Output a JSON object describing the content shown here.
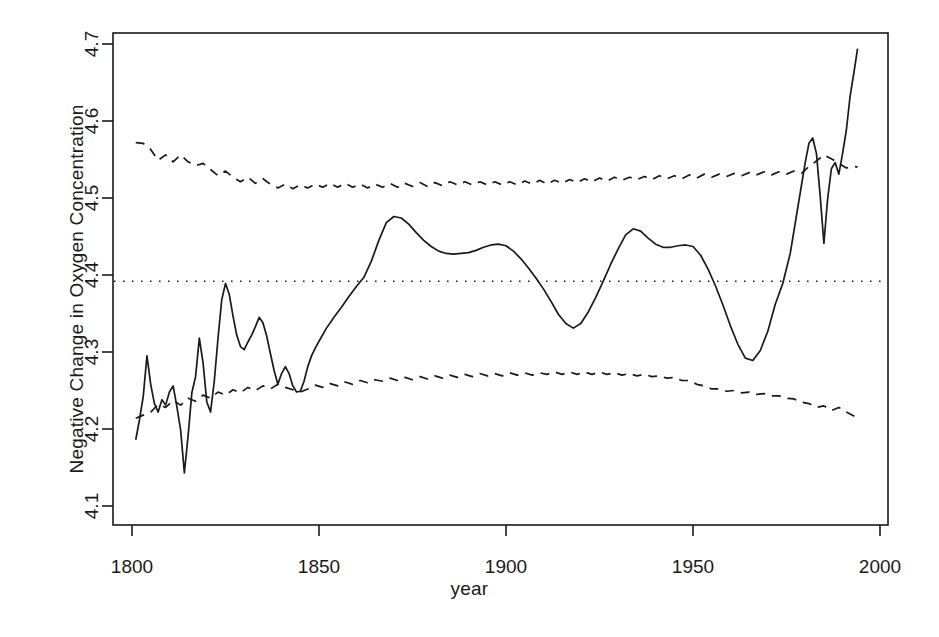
{
  "chart_data": {
    "type": "line",
    "title": "",
    "xlabel": "year",
    "ylabel": "Negative Change in Oxygen Concentration",
    "xlim": [
      1801,
      1995
    ],
    "ylim": [
      4.085,
      4.715
    ],
    "xticks": [
      1800,
      1850,
      1900,
      1950,
      2000
    ],
    "yticks": [
      4.1,
      4.2,
      4.3,
      4.4,
      4.5,
      4.6,
      4.7
    ],
    "grid": false,
    "legend": null,
    "reference_line": {
      "style": "dotted",
      "orientation": "horizontal",
      "y": 4.392,
      "label": ""
    },
    "series": [
      {
        "name": "estimate",
        "style": "solid",
        "color": "#1a1a1a",
        "x": [
          1801,
          1802,
          1803,
          1804,
          1805,
          1806,
          1807,
          1808,
          1809,
          1810,
          1811,
          1812,
          1813,
          1814,
          1815,
          1816,
          1817,
          1818,
          1819,
          1820,
          1821,
          1822,
          1823,
          1824,
          1825,
          1826,
          1827,
          1828,
          1829,
          1830,
          1831,
          1832,
          1833,
          1834,
          1835,
          1836,
          1837,
          1838,
          1839,
          1840,
          1841,
          1842,
          1843,
          1844,
          1845,
          1846,
          1847,
          1848,
          1849,
          1850,
          1852,
          1854,
          1856,
          1858,
          1860,
          1862,
          1864,
          1866,
          1868,
          1870,
          1872,
          1874,
          1876,
          1878,
          1880,
          1882,
          1884,
          1886,
          1888,
          1890,
          1892,
          1894,
          1896,
          1898,
          1900,
          1902,
          1904,
          1906,
          1908,
          1910,
          1912,
          1914,
          1916,
          1918,
          1920,
          1922,
          1924,
          1926,
          1928,
          1930,
          1932,
          1934,
          1936,
          1938,
          1940,
          1942,
          1944,
          1946,
          1948,
          1950,
          1952,
          1954,
          1956,
          1958,
          1960,
          1962,
          1964,
          1966,
          1968,
          1970,
          1972,
          1974,
          1976,
          1978,
          1980,
          1981,
          1982,
          1983,
          1984,
          1985,
          1986,
          1987,
          1988,
          1989,
          1990,
          1991,
          1992,
          1993,
          1994
        ],
        "y": [
          4.186,
          4.212,
          4.242,
          4.295,
          4.258,
          4.233,
          4.222,
          4.238,
          4.231,
          4.248,
          4.256,
          4.229,
          4.199,
          4.143,
          4.191,
          4.247,
          4.268,
          4.318,
          4.286,
          4.235,
          4.222,
          4.262,
          4.318,
          4.368,
          4.389,
          4.375,
          4.347,
          4.322,
          4.307,
          4.303,
          4.313,
          4.322,
          4.333,
          4.345,
          4.338,
          4.321,
          4.298,
          4.276,
          4.258,
          4.272,
          4.281,
          4.272,
          4.256,
          4.248,
          4.249,
          4.262,
          4.281,
          4.295,
          4.305,
          4.314,
          4.331,
          4.345,
          4.358,
          4.372,
          4.385,
          4.397,
          4.418,
          4.445,
          4.468,
          4.476,
          4.474,
          4.466,
          4.455,
          4.445,
          4.437,
          4.431,
          4.428,
          4.427,
          4.428,
          4.429,
          4.432,
          4.436,
          4.439,
          4.44,
          4.438,
          4.431,
          4.421,
          4.409,
          4.396,
          4.382,
          4.366,
          4.349,
          4.337,
          4.331,
          4.337,
          4.352,
          4.371,
          4.392,
          4.414,
          4.434,
          4.452,
          4.46,
          4.457,
          4.448,
          4.44,
          4.436,
          4.436,
          4.438,
          4.439,
          4.437,
          4.426,
          4.408,
          4.386,
          4.361,
          4.334,
          4.31,
          4.292,
          4.289,
          4.302,
          4.327,
          4.362,
          4.389,
          4.428,
          4.487,
          4.546,
          4.571,
          4.578,
          4.558,
          4.503,
          4.441,
          4.499,
          4.538,
          4.546,
          4.531,
          4.558,
          4.588,
          4.632,
          4.662,
          4.694
        ]
      },
      {
        "name": "upper-confidence-bound",
        "style": "dashed",
        "color": "#1a1a1a",
        "x": [
          1801,
          1803,
          1805,
          1807,
          1809,
          1811,
          1813,
          1815,
          1817,
          1819,
          1821,
          1823,
          1825,
          1827,
          1829,
          1831,
          1833,
          1835,
          1837,
          1839,
          1841,
          1843,
          1845,
          1847,
          1849,
          1851,
          1853,
          1855,
          1857,
          1859,
          1861,
          1863,
          1865,
          1867,
          1869,
          1871,
          1873,
          1875,
          1877,
          1879,
          1881,
          1883,
          1885,
          1887,
          1889,
          1891,
          1893,
          1895,
          1897,
          1899,
          1901,
          1903,
          1905,
          1907,
          1909,
          1911,
          1913,
          1915,
          1917,
          1919,
          1921,
          1923,
          1925,
          1927,
          1929,
          1931,
          1933,
          1935,
          1937,
          1939,
          1941,
          1943,
          1945,
          1947,
          1949,
          1951,
          1953,
          1955,
          1957,
          1959,
          1961,
          1963,
          1965,
          1967,
          1969,
          1971,
          1973,
          1975,
          1977,
          1979,
          1981,
          1983,
          1985,
          1987,
          1989,
          1991,
          1993,
          1994
        ],
        "y": [
          4.572,
          4.571,
          4.563,
          4.549,
          4.556,
          4.547,
          4.556,
          4.547,
          4.542,
          4.545,
          4.537,
          4.529,
          4.535,
          4.527,
          4.521,
          4.527,
          4.519,
          4.525,
          4.518,
          4.513,
          4.518,
          4.512,
          4.517,
          4.513,
          4.518,
          4.514,
          4.519,
          4.514,
          4.519,
          4.514,
          4.518,
          4.513,
          4.518,
          4.514,
          4.519,
          4.514,
          4.519,
          4.515,
          4.52,
          4.515,
          4.52,
          4.516,
          4.521,
          4.517,
          4.521,
          4.517,
          4.521,
          4.517,
          4.521,
          4.517,
          4.521,
          4.517,
          4.522,
          4.518,
          4.523,
          4.518,
          4.523,
          4.519,
          4.524,
          4.52,
          4.525,
          4.521,
          4.526,
          4.522,
          4.527,
          4.523,
          4.527,
          4.524,
          4.528,
          4.524,
          4.529,
          4.525,
          4.529,
          4.525,
          4.53,
          4.526,
          4.531,
          4.527,
          4.531,
          4.528,
          4.532,
          4.529,
          4.533,
          4.53,
          4.534,
          4.53,
          4.534,
          4.531,
          4.535,
          4.532,
          4.541,
          4.548,
          4.556,
          4.551,
          4.545,
          4.539,
          4.541,
          4.54
        ]
      },
      {
        "name": "lower-confidence-bound",
        "style": "dashed",
        "color": "#1a1a1a",
        "x": [
          1801,
          1803,
          1805,
          1807,
          1809,
          1811,
          1813,
          1815,
          1817,
          1819,
          1821,
          1823,
          1825,
          1827,
          1829,
          1831,
          1833,
          1835,
          1837,
          1839,
          1841,
          1843,
          1845,
          1847,
          1849,
          1851,
          1853,
          1855,
          1857,
          1859,
          1861,
          1863,
          1865,
          1867,
          1869,
          1871,
          1873,
          1875,
          1877,
          1879,
          1881,
          1883,
          1885,
          1887,
          1889,
          1891,
          1893,
          1895,
          1897,
          1899,
          1901,
          1903,
          1905,
          1907,
          1909,
          1911,
          1913,
          1915,
          1917,
          1919,
          1921,
          1923,
          1925,
          1927,
          1929,
          1931,
          1933,
          1935,
          1937,
          1939,
          1941,
          1943,
          1945,
          1947,
          1949,
          1951,
          1953,
          1955,
          1957,
          1959,
          1961,
          1963,
          1965,
          1967,
          1969,
          1971,
          1973,
          1975,
          1977,
          1979,
          1981,
          1983,
          1985,
          1987,
          1989,
          1991,
          1993,
          1994
        ],
        "y": [
          4.214,
          4.218,
          4.222,
          4.232,
          4.228,
          4.237,
          4.231,
          4.24,
          4.236,
          4.244,
          4.24,
          4.248,
          4.244,
          4.251,
          4.247,
          4.254,
          4.25,
          4.256,
          4.252,
          4.258,
          4.254,
          4.251,
          4.248,
          4.252,
          4.257,
          4.254,
          4.259,
          4.256,
          4.261,
          4.258,
          4.263,
          4.26,
          4.264,
          4.262,
          4.266,
          4.263,
          4.267,
          4.264,
          4.268,
          4.265,
          4.269,
          4.266,
          4.27,
          4.267,
          4.271,
          4.268,
          4.272,
          4.269,
          4.272,
          4.269,
          4.273,
          4.27,
          4.273,
          4.27,
          4.273,
          4.271,
          4.274,
          4.271,
          4.274,
          4.271,
          4.274,
          4.271,
          4.274,
          4.271,
          4.273,
          4.27,
          4.272,
          4.269,
          4.271,
          4.268,
          4.269,
          4.266,
          4.267,
          4.263,
          4.263,
          4.258,
          4.256,
          4.252,
          4.252,
          4.249,
          4.25,
          4.247,
          4.248,
          4.245,
          4.246,
          4.243,
          4.243,
          4.24,
          4.239,
          4.235,
          4.233,
          4.228,
          4.23,
          4.224,
          4.228,
          4.222,
          4.217,
          4.212
        ]
      }
    ]
  }
}
